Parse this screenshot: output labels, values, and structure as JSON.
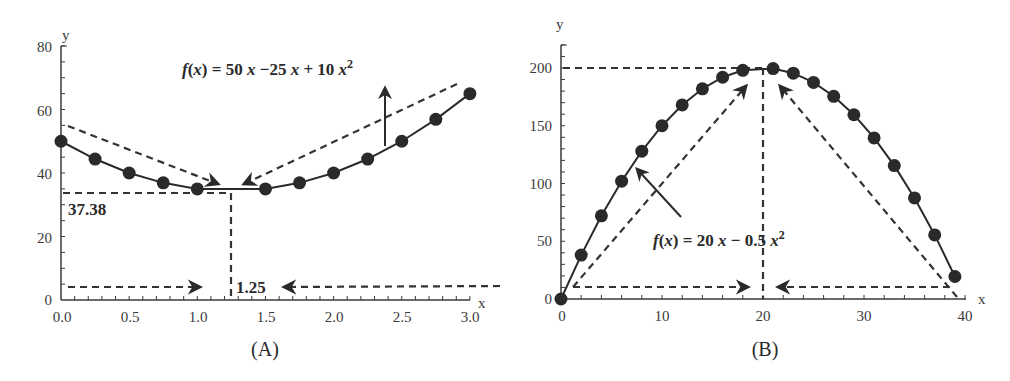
{
  "chart_data": [
    {
      "id": "A",
      "type": "line",
      "caption": "(A)",
      "title": "",
      "xlabel": "x",
      "ylabel": "y",
      "xlim": [
        0,
        3.0
      ],
      "ylim": [
        0,
        80
      ],
      "x_ticks": [
        "0.0",
        "0.5",
        "1.0",
        "1.5",
        "2.0",
        "2.5",
        "3.0"
      ],
      "y_ticks": [
        "0",
        "20",
        "40",
        "60",
        "80"
      ],
      "grid": false,
      "series": [
        {
          "name": "f(x)",
          "x": [
            0,
            0.25,
            0.5,
            0.75,
            1.0,
            1.5,
            1.75,
            2.0,
            2.25,
            2.5,
            2.75,
            3.0
          ],
          "values": [
            50,
            44.4,
            40,
            36.9,
            35,
            35,
            36.9,
            40,
            44.4,
            50,
            56.9,
            65
          ]
        }
      ],
      "annotations": {
        "formula": "f(x) = 50 x −25 x + 10 x",
        "formula_exp": "2",
        "min_y_label": "37.38",
        "min_x_label": "1.25",
        "min_point": [
          1.25,
          34.4
        ]
      }
    },
    {
      "id": "B",
      "type": "line",
      "caption": "(B)",
      "title": "",
      "xlabel": "x",
      "ylabel": "y",
      "xlim": [
        0,
        40
      ],
      "ylim": [
        0,
        220
      ],
      "x_ticks": [
        "0",
        "10",
        "20",
        "30",
        "40"
      ],
      "y_ticks": [
        "0",
        "50",
        "100",
        "150",
        "200"
      ],
      "grid": false,
      "series": [
        {
          "name": "f(x)",
          "x": [
            0,
            2,
            4,
            6,
            8,
            10,
            12,
            14,
            16,
            18,
            21,
            23,
            25,
            27,
            29,
            31,
            33,
            35,
            37,
            39
          ],
          "values": [
            0,
            38,
            72,
            102,
            128,
            150,
            168,
            182,
            192,
            198,
            199.5,
            195.5,
            187.5,
            175.5,
            159.5,
            139.5,
            115.5,
            87.5,
            55.5,
            19.5
          ]
        }
      ],
      "annotations": {
        "formula": "f(x) = 20 x − 0.5 x",
        "formula_exp": "2",
        "max_point": [
          20,
          200
        ]
      }
    }
  ]
}
